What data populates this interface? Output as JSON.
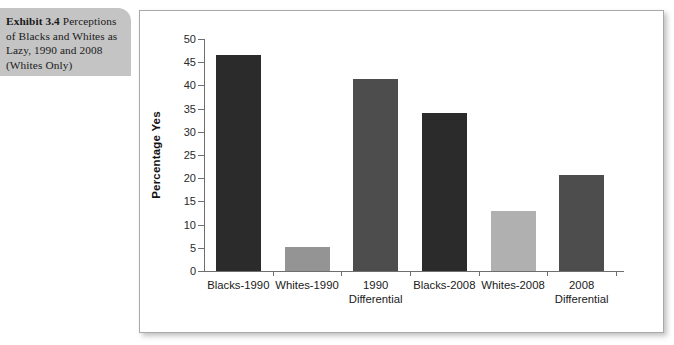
{
  "caption": {
    "exhibit_label": "Exhibit 3.4",
    "text": " Perceptions of Blacks and Whites as Lazy, 1990 and 2008 (Whites Only)"
  },
  "colors": {
    "caption_background": "#c4c4c4",
    "panel_background": "#ffffff",
    "panel_border": "#a9a9a9",
    "axis": "#6e6e6e",
    "bar_black": "#2b2b2b",
    "bar_dark_gray": "#4d4d4d",
    "bar_mid_gray": "#949494",
    "bar_light_gray": "#b0b0b0"
  },
  "chart_data": {
    "type": "bar",
    "title": "",
    "xlabel": "",
    "ylabel": "Percentage Yes",
    "ylim": [
      0,
      50
    ],
    "yticks": [
      0,
      5,
      10,
      15,
      20,
      25,
      30,
      35,
      40,
      45,
      50
    ],
    "ytick_labels": [
      "0",
      "5",
      "10",
      "15",
      "20",
      "25",
      "30",
      "35",
      "40",
      "45",
      "50"
    ],
    "grid": false,
    "legend": "none",
    "categories": [
      "Blacks-1990",
      "Whites-1990",
      "1990 Differential",
      "Blacks-2008",
      "Whites-2008",
      "2008 Differential"
    ],
    "category_lines": [
      [
        "Blacks-1990"
      ],
      [
        "Whites-1990"
      ],
      [
        "1990",
        "Differential"
      ],
      [
        "Blacks-2008"
      ],
      [
        "Whites-2008"
      ],
      [
        "2008",
        "Differential"
      ]
    ],
    "values": [
      46.5,
      5.1,
      41.4,
      34.0,
      13.0,
      20.7
    ],
    "bar_colors": [
      "#2b2b2b",
      "#949494",
      "#4d4d4d",
      "#2b2b2b",
      "#b0b0b0",
      "#4d4d4d"
    ]
  }
}
